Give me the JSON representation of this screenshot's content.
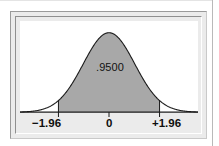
{
  "figure": {
    "name": "standard-normal-95-percent-confidence",
    "area_label": ".9500",
    "axis_ticks": [
      {
        "label": "−1.96",
        "value": -1.96
      },
      {
        "label": "0",
        "value": 0
      },
      {
        "label": "+1.96",
        "value": 1.96
      }
    ],
    "colors": {
      "shade_fill": "#a8a8a8",
      "curve_stroke": "#1a1a1a",
      "axis_stroke": "#1a1a1a",
      "plot_background": "#ffffff",
      "frame_background": "#ebebeb",
      "page_background": "#ffffff"
    }
  },
  "chart_data": {
    "type": "area",
    "title": "",
    "subtitle": "",
    "xlabel": "",
    "ylabel": "",
    "distribution": "standard normal",
    "mean": 0,
    "sd": 1,
    "xlim": [
      -3.45,
      3.45
    ],
    "ylim": [
      0,
      0.43
    ],
    "grid": false,
    "legend": null,
    "shaded_interval": [
      -1.96,
      1.96
    ],
    "shaded_area": 0.95,
    "annotations": [
      {
        "text": ".9500",
        "x": 0,
        "y": 0.175
      }
    ],
    "xticks": [
      -1.96,
      0,
      1.96
    ],
    "xticklabels": [
      "−1.96",
      "0",
      "+1.96"
    ],
    "yticks": [],
    "yticklabels": [],
    "x": [
      -3.45,
      -3.2,
      -2.95,
      -2.7,
      -2.45,
      -2.2,
      -1.96,
      -1.7,
      -1.45,
      -1.2,
      -0.95,
      -0.7,
      -0.45,
      -0.2,
      0,
      0.2,
      0.45,
      0.7,
      0.95,
      1.2,
      1.45,
      1.7,
      1.96,
      2.2,
      2.45,
      2.7,
      2.95,
      3.2,
      3.45
    ],
    "y": [
      0.001,
      0.0024,
      0.0051,
      0.0104,
      0.0198,
      0.0355,
      0.0584,
      0.094,
      0.1394,
      0.1942,
      0.2541,
      0.3123,
      0.3605,
      0.391,
      0.3989,
      0.391,
      0.3605,
      0.3123,
      0.2541,
      0.1942,
      0.1394,
      0.094,
      0.0584,
      0.0355,
      0.0198,
      0.0104,
      0.0051,
      0.0024,
      0.001
    ]
  }
}
